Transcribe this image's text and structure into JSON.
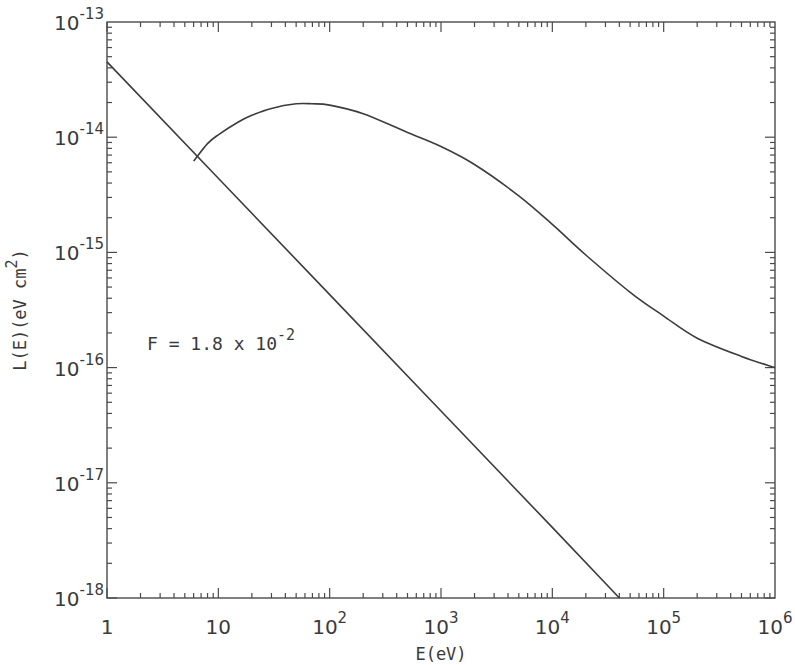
{
  "chart_data": {
    "type": "line",
    "title": "",
    "xlabel": "E(eV)",
    "ylabel_main": "L(E)(eV cm",
    "ylabel_sup": "2",
    "ylabel_close": ")",
    "xscale": "log",
    "yscale": "log",
    "xlim": [
      1,
      1000000
    ],
    "ylim": [
      1e-18,
      1e-13
    ],
    "grid": false,
    "x_ticks": [
      {
        "value": 1,
        "base": "1",
        "exp": ""
      },
      {
        "value": 10,
        "base": "10",
        "exp": ""
      },
      {
        "value": 100,
        "base": "10",
        "exp": "2"
      },
      {
        "value": 1000,
        "base": "10",
        "exp": "3"
      },
      {
        "value": 10000,
        "base": "10",
        "exp": "4"
      },
      {
        "value": 100000,
        "base": "10",
        "exp": "5"
      },
      {
        "value": 1000000,
        "base": "10",
        "exp": "6"
      }
    ],
    "y_ticks": [
      {
        "value": 1e-13,
        "base": "10",
        "exp": "-13"
      },
      {
        "value": 1e-14,
        "base": "10",
        "exp": "-14"
      },
      {
        "value": 1e-15,
        "base": "10",
        "exp": "-15"
      },
      {
        "value": 1e-16,
        "base": "10",
        "exp": "-16"
      },
      {
        "value": 1e-17,
        "base": "10",
        "exp": "-17"
      },
      {
        "value": 1e-18,
        "base": "10",
        "exp": "-18"
      }
    ],
    "annotation": {
      "text": "F = 1.8 x 10",
      "sup": "-2"
    },
    "series": [
      {
        "name": "power-law line",
        "x": [
          1,
          10,
          100,
          1000,
          10000,
          40000
        ],
        "y": [
          4.5e-14,
          4.4e-15,
          4.3e-16,
          4.2e-17,
          4.1e-18,
          1e-18
        ]
      },
      {
        "name": "loss curve",
        "x": [
          6,
          8,
          10,
          15,
          20,
          30,
          50,
          70,
          100,
          200,
          500,
          1000,
          2000,
          5000,
          10000,
          20000,
          50000,
          100000,
          200000,
          500000,
          1000000
        ],
        "y": [
          6.2e-15,
          8.8e-15,
          1.05e-14,
          1.35e-14,
          1.55e-14,
          1.78e-14,
          1.95e-14,
          1.95e-14,
          1.9e-14,
          1.6e-14,
          1.1e-14,
          8.3e-15,
          5.8e-15,
          3.1e-15,
          1.75e-15,
          9.5e-16,
          4.5e-16,
          2.8e-16,
          1.8e-16,
          1.25e-16,
          1e-16
        ]
      }
    ]
  }
}
